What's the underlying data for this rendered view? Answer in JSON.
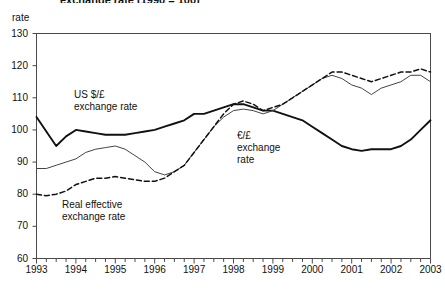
{
  "figure": {
    "title_partial": "exchange rate (1990 = 100)",
    "y_axis_name": "rate"
  },
  "chart_data": {
    "type": "line",
    "title": "exchange rate (1990 = 100)",
    "xlabel": "",
    "ylabel": "rate",
    "ylim": [
      60,
      130
    ],
    "yticks": [
      60,
      70,
      80,
      90,
      100,
      110,
      120,
      130
    ],
    "xlim": [
      1993,
      2003
    ],
    "xticks": [
      1993,
      1994,
      1995,
      1996,
      1997,
      1998,
      1999,
      2000,
      2001,
      2002,
      2003
    ],
    "x_minor_interval": 0.25,
    "grid": false,
    "legend": "none (inline annotations)",
    "annotations": [
      {
        "id": "usd",
        "lines": [
          "US $/£",
          "exchange rate"
        ],
        "series": "US $/£ exchange rate"
      },
      {
        "id": "eur",
        "lines": [
          "€/£",
          "exchange",
          "rate"
        ],
        "series": "€/£ exchange rate"
      },
      {
        "id": "reer",
        "lines": [
          "Real effective",
          "exchange rate"
        ],
        "series": "Real effective exchange rate"
      }
    ],
    "x": [
      1993.0,
      1993.25,
      1993.5,
      1993.75,
      1994.0,
      1994.25,
      1994.5,
      1994.75,
      1995.0,
      1995.25,
      1995.5,
      1995.75,
      1996.0,
      1996.25,
      1996.5,
      1996.75,
      1997.0,
      1997.25,
      1997.5,
      1997.75,
      1998.0,
      1998.25,
      1998.5,
      1998.75,
      1999.0,
      1999.25,
      1999.5,
      1999.75,
      2000.0,
      2000.25,
      2000.5,
      2000.75,
      2001.0,
      2001.25,
      2001.5,
      2001.75,
      2002.0,
      2002.25,
      2002.5,
      2002.75,
      2003.0
    ],
    "series": [
      {
        "name": "US $/£ exchange rate",
        "style": "solid-thick",
        "color": "#111111",
        "values": [
          104,
          99.5,
          95,
          98,
          100,
          99.5,
          99,
          98.5,
          98.5,
          98.5,
          99,
          99.5,
          100,
          101,
          102,
          103,
          105,
          105,
          106,
          107,
          108,
          108,
          107,
          106,
          106,
          105,
          104,
          103,
          101,
          99,
          97,
          95,
          94,
          93.5,
          94,
          94,
          94,
          95,
          97,
          100,
          103
        ]
      },
      {
        "name": "€/£ exchange rate",
        "style": "solid-thin",
        "color": "#444444",
        "values": [
          88,
          88,
          89,
          90,
          91,
          93,
          94,
          94.5,
          95,
          94,
          92,
          90,
          87,
          86,
          87,
          89,
          93,
          97,
          101,
          104,
          106,
          106.5,
          106,
          105,
          106,
          108,
          110,
          112,
          114,
          116,
          117,
          116,
          114,
          113,
          111,
          113,
          114,
          115,
          117,
          117,
          115
        ]
      },
      {
        "name": "Real effective exchange rate",
        "style": "dashed",
        "color": "#111111",
        "values": [
          80,
          79.5,
          80,
          81,
          83,
          84,
          85,
          85,
          85.5,
          85,
          84.5,
          84,
          84,
          85,
          87,
          89,
          93,
          97,
          101,
          105,
          108,
          109,
          108,
          106,
          107,
          108,
          110,
          112,
          114,
          116,
          118,
          118,
          117,
          116,
          115,
          116,
          117,
          118,
          118,
          119,
          118
        ]
      }
    ]
  },
  "y_axis_labels": [
    "130",
    "120",
    "110",
    "100",
    "90",
    "80",
    "70",
    "60"
  ],
  "x_axis_labels": [
    "1993",
    "1994",
    "1995",
    "1996",
    "1997",
    "1998",
    "1999",
    "2000",
    "2001",
    "2002",
    "2003"
  ],
  "annotations": {
    "usd_line1": "US $/£",
    "usd_line2": "exchange rate",
    "eur_line1": "€/£",
    "eur_line2": "exchange",
    "eur_line3": "rate",
    "reer_line1": "Real effective",
    "reer_line2": "exchange rate"
  }
}
